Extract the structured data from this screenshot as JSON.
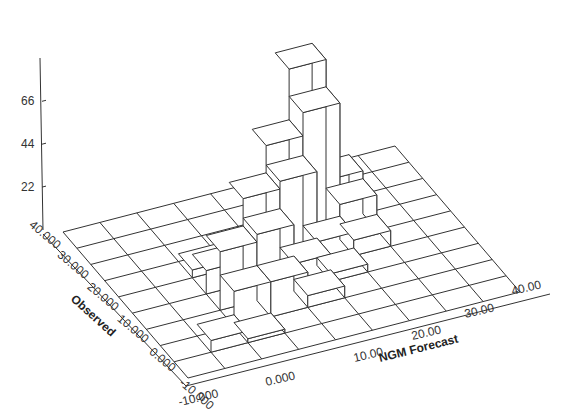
{
  "chart_data": {
    "type": "bar3d",
    "title": "",
    "xlabel": "NGM Forecast",
    "ylabel": "Observed",
    "zlabel": "",
    "x_ticks": [
      "-10.000",
      "0.000",
      "10.00",
      "20.00",
      "30.00",
      "40.00"
    ],
    "y_ticks": [
      "40.000",
      "30.000",
      "20.000",
      "10.000",
      "0.000",
      "-10.000"
    ],
    "z_ticks": [
      "22",
      "44",
      "66"
    ],
    "x_range": [
      -10,
      40
    ],
    "y_range": [
      -10,
      40
    ],
    "z_range": [
      0,
      86
    ],
    "grid": true,
    "bins": 9,
    "note": "heights[i][j]: i = forecast bin (from -10 upward), j = observed bin (from -10 upward); approximate counts read off the 3D bars",
    "heights": [
      [
        0,
        0,
        0,
        0,
        0,
        0,
        0,
        0,
        0
      ],
      [
        0,
        6,
        0,
        0,
        0,
        0,
        0,
        0,
        0
      ],
      [
        0,
        2,
        18,
        30,
        12,
        4,
        0,
        0,
        0
      ],
      [
        0,
        0,
        18,
        34,
        44,
        6,
        0,
        0,
        0
      ],
      [
        0,
        0,
        6,
        14,
        48,
        58,
        0,
        0,
        0
      ],
      [
        0,
        0,
        0,
        4,
        12,
        70,
        84,
        0,
        0
      ],
      [
        0,
        0,
        0,
        0,
        8,
        18,
        22,
        0,
        0
      ],
      [
        0,
        0,
        0,
        0,
        0,
        0,
        0,
        0,
        0
      ],
      [
        0,
        0,
        0,
        0,
        0,
        0,
        0,
        0,
        0
      ]
    ]
  },
  "colors": {
    "bar_fill": "#ffffff",
    "line": "#333333",
    "background": "#ffffff"
  }
}
